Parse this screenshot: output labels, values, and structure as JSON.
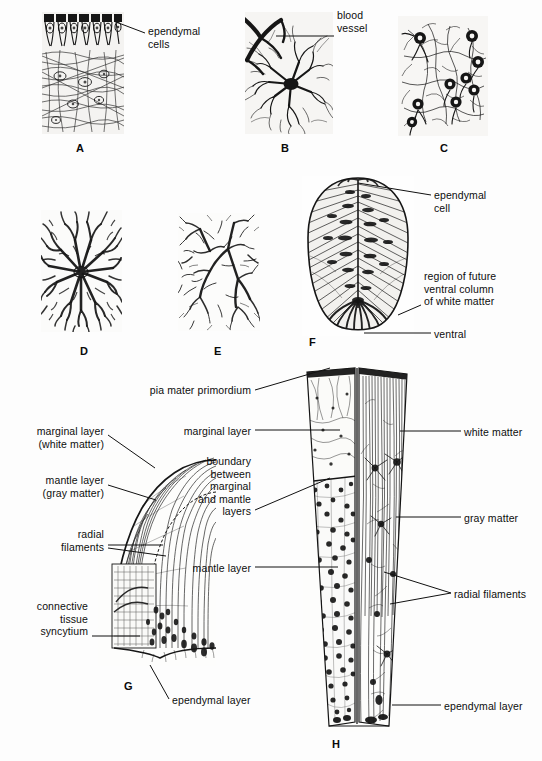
{
  "figure": {
    "background": "#fdfdfd",
    "ink": "#161616",
    "text_color": "#0d0d0d"
  },
  "panels": [
    {
      "id": "A",
      "letter": "A",
      "x": 42,
      "y": 12,
      "w": 82,
      "h": 122,
      "letter_x": 76,
      "letter_y": 142,
      "kind": "ependymal-columnar-tissue"
    },
    {
      "id": "B",
      "letter": "B",
      "x": 245,
      "y": 12,
      "w": 88,
      "h": 122,
      "letter_x": 281,
      "letter_y": 142,
      "kind": "astrocyte-with-vessel"
    },
    {
      "id": "C",
      "letter": "C",
      "x": 398,
      "y": 16,
      "w": 90,
      "h": 120,
      "letter_x": 440,
      "letter_y": 142,
      "kind": "glial-cell-field"
    },
    {
      "id": "D",
      "letter": "D",
      "x": 41,
      "y": 210,
      "w": 81,
      "h": 122,
      "letter_x": 80,
      "letter_y": 345,
      "kind": "dense-protoplasmic-astrocyte"
    },
    {
      "id": "E",
      "letter": "E",
      "x": 178,
      "y": 213,
      "w": 82,
      "h": 118,
      "letter_x": 214,
      "letter_y": 345,
      "kind": "fibrous-astrocyte-network"
    },
    {
      "id": "F",
      "letter": "F",
      "x": 302,
      "y": 176,
      "w": 112,
      "h": 160,
      "letter_x": 309,
      "letter_y": 336,
      "kind": "neural-tube-cross-section"
    },
    {
      "id": "G",
      "letter": "G",
      "x": 98,
      "y": 452,
      "w": 118,
      "h": 214,
      "letter_x": 124,
      "letter_y": 680,
      "kind": "quarter-cord-section"
    },
    {
      "id": "H",
      "letter": "H",
      "x": 303,
      "y": 364,
      "w": 108,
      "h": 368,
      "letter_x": 332,
      "letter_y": 738,
      "kind": "cord-wall-wedge"
    }
  ],
  "labels": [
    {
      "id": "a-ependymal-cells",
      "text": "ependymal\ncells",
      "x": 148,
      "y": 25,
      "align": "left",
      "panel": "A",
      "leader": {
        "x1": 145,
        "y1": 33,
        "x2": 116,
        "y2": 22
      }
    },
    {
      "id": "b-blood-vessel",
      "text": "blood\nvessel",
      "x": 337,
      "y": 9,
      "align": "left",
      "panel": "B",
      "leader": {
        "x1": 334,
        "y1": 36,
        "x2": 276,
        "y2": 36
      }
    },
    {
      "id": "f-ependymal-cell",
      "text": "ependymal\ncell",
      "x": 434,
      "y": 189,
      "align": "left",
      "panel": "F",
      "leader": {
        "x1": 431,
        "y1": 195,
        "x2": 358,
        "y2": 183
      }
    },
    {
      "id": "f-ventral-column",
      "text": "region of future\nventral column\nof white matter",
      "x": 424,
      "y": 270,
      "align": "left",
      "panel": "F",
      "leader": {
        "x1": 421,
        "y1": 305,
        "x2": 398,
        "y2": 315
      }
    },
    {
      "id": "f-ventral",
      "text": "ventral",
      "x": 434,
      "y": 328,
      "align": "left",
      "panel": "F",
      "leader": {
        "x1": 431,
        "y1": 333,
        "x2": 364,
        "y2": 333
      }
    },
    {
      "id": "h-pia-mater-primordium",
      "text": "pia mater primordium",
      "x": 251,
      "y": 384,
      "align": "right",
      "panel": "H",
      "leader": {
        "x1": 255,
        "y1": 390,
        "x2": 330,
        "y2": 368
      }
    },
    {
      "id": "g-marginal-layer-white",
      "text": "marginal layer\n(white matter)",
      "x": 104,
      "y": 425,
      "align": "right",
      "panel": "G",
      "leader": {
        "x1": 108,
        "y1": 435,
        "x2": 155,
        "y2": 468
      }
    },
    {
      "id": "h-marginal-layer",
      "text": "marginal layer",
      "x": 251,
      "y": 425,
      "align": "right",
      "panel": "H",
      "leader": {
        "x1": 255,
        "y1": 430,
        "x2": 340,
        "y2": 430
      }
    },
    {
      "id": "g-mantle-layer-gray",
      "text": "mantle layer\n(gray matter)",
      "x": 104,
      "y": 474,
      "align": "right",
      "panel": "G",
      "leader": {
        "x1": 108,
        "y1": 485,
        "x2": 156,
        "y2": 500
      }
    },
    {
      "id": "h-boundary-layers",
      "text": "boundary\nbetween\nmarginal\nand mantle\nlayers",
      "x": 251,
      "y": 455,
      "align": "right",
      "panel": "H",
      "leader": {
        "x1": 255,
        "y1": 510,
        "x2": 330,
        "y2": 478
      }
    },
    {
      "id": "h-white-matter",
      "text": "white matter",
      "x": 464,
      "y": 426,
      "align": "left",
      "panel": "H",
      "leader": {
        "x1": 461,
        "y1": 431,
        "x2": 400,
        "y2": 431
      }
    },
    {
      "id": "g-radial-filaments",
      "text": "radial\nfilaments",
      "x": 104,
      "y": 528,
      "align": "right",
      "panel": "G",
      "leader": {
        "x1": 108,
        "y1": 545,
        "x2": 163,
        "y2": 545
      }
    },
    {
      "id": "h-gray-matter",
      "text": "gray matter",
      "x": 464,
      "y": 512,
      "align": "left",
      "panel": "H",
      "leader": {
        "x1": 461,
        "y1": 517,
        "x2": 396,
        "y2": 517
      }
    },
    {
      "id": "h-mantle-layer",
      "text": "mantle layer",
      "x": 251,
      "y": 562,
      "align": "right",
      "panel": "H",
      "leader": {
        "x1": 255,
        "y1": 567,
        "x2": 338,
        "y2": 567
      }
    },
    {
      "id": "h-radial-filaments",
      "text": "radial filaments",
      "x": 454,
      "y": 588,
      "align": "left",
      "panel": "H",
      "leader": {
        "x1": 451,
        "y1": 593,
        "x2": 384,
        "y2": 572
      }
    },
    {
      "id": "g-connective-tissue",
      "text": "connective\ntissue\nsyncytium",
      "x": 88,
      "y": 600,
      "align": "right",
      "panel": "G",
      "leader": {
        "x1": 92,
        "y1": 636,
        "x2": 140,
        "y2": 636
      }
    },
    {
      "id": "g-ependymal-layer",
      "text": "ependymal layer",
      "x": 172,
      "y": 694,
      "align": "left",
      "panel": "G",
      "leader": {
        "x1": 169,
        "y1": 699,
        "x2": 150,
        "y2": 665
      }
    },
    {
      "id": "h-ependymal-layer",
      "text": "ependymal layer",
      "x": 444,
      "y": 700,
      "align": "left",
      "panel": "H",
      "leader": {
        "x1": 441,
        "y1": 705,
        "x2": 392,
        "y2": 705
      }
    }
  ]
}
